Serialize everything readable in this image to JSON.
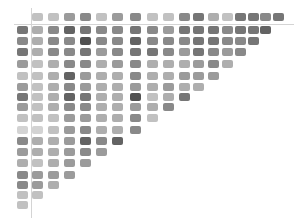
{
  "chart_data": {
    "type": "heatmap",
    "title": "",
    "layout": "triangular-matrix",
    "grid": false,
    "legend": "none",
    "header_row": {
      "label": "top reference row",
      "values": [
        2,
        2,
        4,
        5,
        2,
        4,
        5,
        2,
        2,
        5,
        6,
        3,
        2,
        6,
        6,
        5,
        6
      ]
    },
    "rows": [
      {
        "left": 6,
        "values": [
          3,
          5,
          7,
          6,
          5,
          5,
          6,
          5,
          4,
          6,
          6,
          6,
          5,
          6,
          6,
          7
        ]
      },
      {
        "left": 5,
        "values": [
          3,
          5,
          5,
          8,
          5,
          5,
          7,
          5,
          5,
          5,
          6,
          6,
          5,
          5,
          6
        ]
      },
      {
        "left": 6,
        "values": [
          3,
          5,
          5,
          6,
          4,
          5,
          6,
          6,
          5,
          4,
          6,
          5,
          4,
          5
        ]
      },
      {
        "left": 4,
        "values": [
          2,
          3,
          5,
          5,
          3,
          4,
          5,
          3,
          3,
          3,
          4,
          5,
          3
        ]
      },
      {
        "left": 2,
        "values": [
          2,
          3,
          7,
          4,
          3,
          3,
          5,
          3,
          3,
          4,
          4,
          4
        ]
      },
      {
        "left": 4,
        "values": [
          2,
          3,
          5,
          4,
          3,
          3,
          4,
          3,
          4,
          3,
          3
        ]
      },
      {
        "left": 6,
        "values": [
          2,
          3,
          7,
          6,
          3,
          3,
          8,
          2,
          3,
          6
        ]
      },
      {
        "left": 4,
        "values": [
          2,
          3,
          5,
          5,
          3,
          3,
          4,
          3,
          5
        ]
      },
      {
        "left": 2,
        "values": [
          2,
          2,
          4,
          4,
          3,
          3,
          5,
          2
        ]
      },
      {
        "left": 1,
        "values": [
          1,
          2,
          4,
          5,
          3,
          3,
          5
        ]
      },
      {
        "left": 5,
        "values": [
          3,
          3,
          4,
          7,
          5,
          7
        ]
      },
      {
        "left": 4,
        "values": [
          3,
          3,
          4,
          5,
          4
        ]
      },
      {
        "left": 3,
        "values": [
          2,
          3,
          4,
          4
        ]
      },
      {
        "left": 5,
        "values": [
          4,
          4,
          4
        ]
      },
      {
        "left": 5,
        "values": [
          4,
          3
        ]
      },
      {
        "left": 2,
        "values": [
          2
        ]
      },
      {
        "left": 2,
        "values": []
      }
    ],
    "value_scale": {
      "min": 0,
      "max": 9,
      "light_color": "#e6e6e6",
      "dark_color": "#3e3e3e"
    },
    "xlabel": "",
    "ylabel": ""
  },
  "layout_hints": {
    "column_x": [
      37,
      53,
      69,
      85,
      101,
      117,
      135,
      152,
      168,
      184,
      198,
      213,
      227,
      240,
      253,
      265,
      278
    ],
    "row_y": [
      30,
      41,
      52,
      64,
      76,
      87,
      97,
      107,
      118,
      130,
      141,
      152,
      163,
      175,
      185,
      195,
      205
    ],
    "header_y": 17,
    "left_x": 22
  }
}
